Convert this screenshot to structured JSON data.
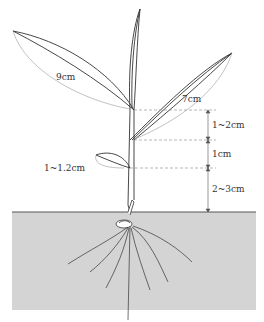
{
  "diagram": {
    "title": "",
    "labels": {
      "leaf_long": "9cm",
      "leaf_mid": "7cm",
      "internode_upper": "1~2cm",
      "internode_mid": "1cm",
      "above_soil": "2~3cm",
      "small_leaf": "1~1.2cm"
    },
    "colors": {
      "soil": "#d4d4d4",
      "line": "#333333",
      "dash": "#888888"
    }
  }
}
